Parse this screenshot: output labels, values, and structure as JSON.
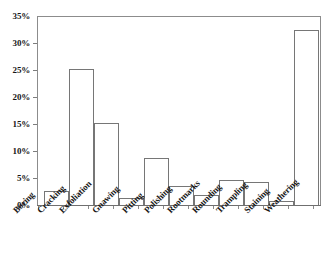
{
  "chart_data": {
    "type": "bar",
    "title": "",
    "subtitle": "",
    "xlabel": "",
    "ylabel": "",
    "categories": [
      "Boring",
      "Cracking",
      "Exfoliation",
      "Gnawing",
      "Pitting",
      "Polishing",
      "Rootmarks",
      "Rounding",
      "Trampling",
      "Staining",
      "Weathering"
    ],
    "values": [
      2.6,
      25.3,
      15.2,
      1.3,
      8.7,
      3.5,
      1.9,
      4.6,
      4.2,
      0.7,
      32.5
    ],
    "value_unit": "percent",
    "ylim": [
      0,
      35
    ],
    "ytick_values": [
      0,
      5,
      10,
      15,
      20,
      25,
      30,
      35
    ],
    "ytick_labels": [
      "0%",
      "5%",
      "10%",
      "15%",
      "20%",
      "25%",
      "30%",
      "35%"
    ],
    "grid": false,
    "legend": null,
    "legend_position": "none",
    "bar_fill_color": "#ffffff",
    "bar_border_color": "#767676",
    "axis_color": "#8c8c8c",
    "background_color": "#ffffff",
    "text_color": "#161616"
  }
}
